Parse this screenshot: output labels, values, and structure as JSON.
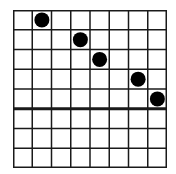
{
  "grid": {
    "rows": 8,
    "cols": 8,
    "line_color": "#1a1a1a",
    "divider_after_row": 5,
    "dots": [
      {
        "row": 0,
        "col": 1
      },
      {
        "row": 1,
        "col": 3
      },
      {
        "row": 2,
        "col": 4
      },
      {
        "row": 3,
        "col": 6
      },
      {
        "row": 4,
        "col": 7
      }
    ],
    "dot_color": "#000000"
  }
}
